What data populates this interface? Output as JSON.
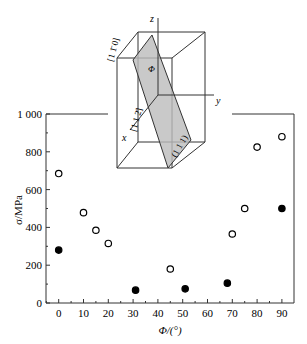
{
  "chart_data": {
    "type": "scatter",
    "title": "",
    "xlabel": "Φ/(°)",
    "ylabel": "σ/MPa",
    "xlim": [
      -5,
      95
    ],
    "ylim": [
      0,
      1000
    ],
    "x_ticks": [
      "0",
      "10",
      "20",
      "30",
      "40",
      "50",
      "60",
      "70",
      "80",
      "90"
    ],
    "y_ticks": [
      "0",
      "200",
      "400",
      "600",
      "800",
      "1 000"
    ],
    "series": [
      {
        "name": "open circles",
        "marker": "open",
        "points": [
          [
            0,
            685
          ],
          [
            10,
            478
          ],
          [
            15,
            385
          ],
          [
            20,
            315
          ],
          [
            45,
            180
          ],
          [
            70,
            365
          ],
          [
            75,
            500
          ],
          [
            80,
            825
          ],
          [
            90,
            880
          ]
        ]
      },
      {
        "name": "filled circles",
        "marker": "filled",
        "points": [
          [
            0,
            280
          ],
          [
            31,
            68
          ],
          [
            51,
            75
          ],
          [
            68,
            105
          ],
          [
            90,
            500
          ]
        ]
      }
    ],
    "inset": {
      "labels": [
        "z",
        "y",
        "x",
        "[1 1̄ 0]",
        "[1 1 2̄]",
        "(1 1 1)",
        "Φ"
      ]
    },
    "grid": false
  }
}
